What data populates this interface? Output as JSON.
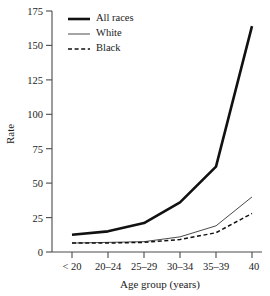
{
  "chart_data": {
    "type": "line",
    "title": "",
    "xlabel": "Age group (years)",
    "ylabel": "Rate",
    "categories": [
      "< 20",
      "20–24",
      "25–29",
      "30–34",
      "35–39",
      "40"
    ],
    "ylim": [
      0,
      175
    ],
    "yticks": [
      0,
      25,
      50,
      75,
      100,
      125,
      150,
      175
    ],
    "ytick_labels": [
      "0",
      "25",
      "50",
      "75",
      "100",
      "125",
      "150",
      "175"
    ],
    "grid": false,
    "legend_position": "top-left",
    "series": [
      {
        "name": "All races",
        "style": "solid-thick",
        "values": [
          12.5,
          15,
          21,
          36,
          62,
          164
        ]
      },
      {
        "name": "White",
        "style": "solid-thin",
        "values": [
          6.5,
          7,
          7.5,
          11,
          19,
          40
        ]
      },
      {
        "name": "Black",
        "style": "dashed",
        "values": [
          6.5,
          6.5,
          7,
          9,
          14,
          28
        ]
      }
    ]
  },
  "axes": {
    "y_title": "Rate",
    "x_title": "Age group (years)",
    "y_tick_labels": [
      "175",
      "150",
      "125",
      "100",
      "75",
      "50",
      "25",
      "0"
    ],
    "x_tick_labels": [
      "< 20",
      "20–24",
      "25–29",
      "30–34",
      "35–39",
      "40"
    ]
  },
  "legend": {
    "items": [
      {
        "label": "All races"
      },
      {
        "label": "White"
      },
      {
        "label": "Black"
      }
    ]
  },
  "colors": {
    "ink": "#1a1a1a",
    "axis": "#4a4a4a",
    "background": "#ffffff"
  }
}
